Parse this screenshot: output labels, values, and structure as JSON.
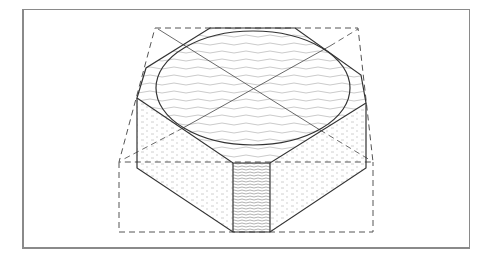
{
  "figure": {
    "colors": {
      "frame": "#8a8a8a",
      "line": "#3a3a3a",
      "dash": "#555555",
      "hatch": "#b0b0b0"
    },
    "elements": [
      "frame-border",
      "dashed-bounding-box",
      "hexagon-outline",
      "top-ellipse",
      "diagonal-construction-lines",
      "left-side-face",
      "right-side-face",
      "front-face"
    ]
  }
}
